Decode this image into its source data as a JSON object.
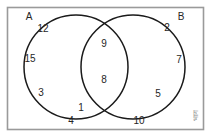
{
  "figure": {
    "background_color": "#ffffff",
    "stroke_color": "#1a1a1a",
    "frame_color": "#9a9a9a",
    "text_color": "#262626"
  },
  "sets": {
    "left_label": "A",
    "right_label": "B"
  },
  "watermark": {
    "text": "भाग"
  },
  "chart_data": {
    "type": "diagram",
    "diagram_type": "venn2",
    "sets": [
      "A",
      "B"
    ],
    "regions": [
      {
        "region": "A_only",
        "values": [
          12,
          15,
          3,
          1
        ]
      },
      {
        "region": "A_and_B",
        "values": [
          9,
          8
        ]
      },
      {
        "region": "B_only",
        "values": [
          2,
          7,
          5
        ]
      },
      {
        "region": "universal_outside",
        "values": [
          4,
          10
        ]
      }
    ],
    "elements": [
      {
        "value": "12",
        "region": "A_only",
        "x": 43,
        "y": 29
      },
      {
        "value": "15",
        "region": "A_only",
        "x": 30,
        "y": 59
      },
      {
        "value": "3",
        "region": "A_only",
        "x": 41,
        "y": 93
      },
      {
        "value": "1",
        "region": "A_only",
        "x": 81,
        "y": 108
      },
      {
        "value": "9",
        "region": "A_and_B",
        "x": 104,
        "y": 44
      },
      {
        "value": "8",
        "region": "A_and_B",
        "x": 104,
        "y": 80
      },
      {
        "value": "2",
        "region": "B_only",
        "x": 167,
        "y": 28
      },
      {
        "value": "7",
        "region": "B_only",
        "x": 179,
        "y": 60
      },
      {
        "value": "5",
        "region": "B_only",
        "x": 158,
        "y": 94
      },
      {
        "value": "4",
        "region": "universal_outside",
        "x": 71,
        "y": 121
      },
      {
        "value": "10",
        "region": "universal_outside",
        "x": 139,
        "y": 121
      }
    ],
    "set_labels": [
      {
        "label": "A",
        "x": 29,
        "y": 17
      },
      {
        "label": "B",
        "x": 181,
        "y": 17
      }
    ],
    "circles": [
      {
        "set": "A",
        "cx": 76,
        "cy": 67,
        "r": 52
      },
      {
        "set": "B",
        "cx": 133,
        "cy": 67,
        "r": 52
      }
    ],
    "frame": {
      "x": 7,
      "y": 7,
      "width": 196,
      "height": 122
    }
  }
}
